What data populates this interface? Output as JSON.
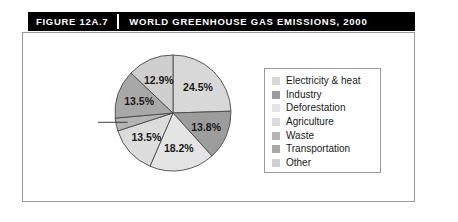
{
  "header": {
    "figure_number": "FIGURE 12A.7",
    "title": "WORLD GREENHOUSE GAS EMISSIONS, 2000"
  },
  "legend": {
    "items": [
      {
        "label": "Electricity & heat",
        "color": "#d8d8d8"
      },
      {
        "label": "Industry",
        "color": "#9d9d9d"
      },
      {
        "label": "Deforestation",
        "color": "#e4e4e4"
      },
      {
        "label": "Agriculture",
        "color": "#dcdcdc"
      },
      {
        "label": "Waste",
        "color": "#b4b4b4"
      },
      {
        "label": "Transportation",
        "color": "#a8a8a8"
      },
      {
        "label": "Other",
        "color": "#cfcfcf"
      }
    ]
  },
  "chart_data": {
    "type": "pie",
    "title": "WORLD GREENHOUSE GAS EMISSIONS, 2000",
    "legend_position": "right",
    "start_angle_deg": 0,
    "direction": "clockwise",
    "categories": [
      "Electricity & heat",
      "Industry",
      "Deforestation",
      "Agriculture",
      "Waste",
      "Transportation",
      "Other"
    ],
    "values": [
      24.5,
      13.8,
      18.2,
      13.5,
      3.6,
      13.5,
      12.9
    ],
    "labels": [
      "24.5%",
      "13.8%",
      "18.2%",
      "13.5%",
      "3.6%",
      "13.5%",
      "12.9%"
    ],
    "colors": [
      "#d8d8d8",
      "#9d9d9d",
      "#e4e4e4",
      "#dcdcdc",
      "#b4b4b4",
      "#a8a8a8",
      "#cfcfcf"
    ],
    "units": "percent",
    "callout_slices": [
      "Waste"
    ]
  }
}
